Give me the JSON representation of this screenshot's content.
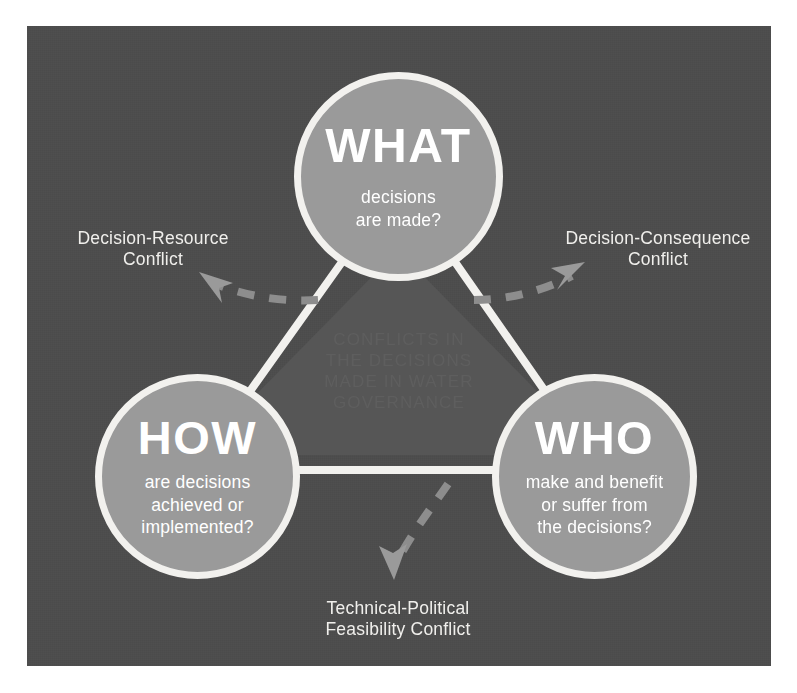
{
  "diagram": {
    "title_caption": "CONFLICTS IN\nTHE DECISIONS\nMADE IN WATER\nGOVERNANCE",
    "background_color": "#4d4d4d",
    "panel_color": "#4d4d4d",
    "circle_fill_color": "#9a9a9a",
    "circle_stroke_color": "#f2f1ee",
    "text_color": "#ffffff",
    "caption_color": "#5e5e5e",
    "arrow_color": "#8d8d8d"
  },
  "nodes": [
    {
      "id": "what",
      "heading": "WHAT",
      "question": "decisions\nare made?"
    },
    {
      "id": "how",
      "heading": "HOW",
      "question": "are decisions\nachieved or\nimplemented?"
    },
    {
      "id": "who",
      "heading": "WHO",
      "question": "make and benefit\nor suffer from\nthe decisions?"
    }
  ],
  "conflicts": [
    {
      "id": "decision-resource",
      "label": "Decision-Resource\nConflict",
      "position": "left"
    },
    {
      "id": "decision-consequence",
      "label": "Decision-Consequence\nConflict",
      "position": "right"
    },
    {
      "id": "technical-political-feasibility",
      "label": "Technical-Political\nFeasibility Conflict",
      "position": "bottom"
    }
  ]
}
